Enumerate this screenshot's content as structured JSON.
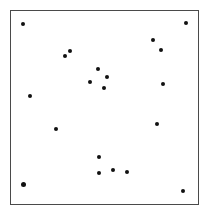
{
  "diagram": {
    "type": "dot-scatter-frame",
    "frame": {
      "x": 10,
      "y": 10,
      "width": 189,
      "height": 195,
      "border_color": "#4a4a4a"
    },
    "dot_color": "#111111",
    "points": [
      {
        "x": 23,
        "y": 24,
        "size": "normal"
      },
      {
        "x": 186,
        "y": 23,
        "size": "normal"
      },
      {
        "x": 65,
        "y": 56,
        "size": "normal"
      },
      {
        "x": 70,
        "y": 51,
        "size": "normal"
      },
      {
        "x": 153,
        "y": 40,
        "size": "normal"
      },
      {
        "x": 161,
        "y": 50,
        "size": "normal"
      },
      {
        "x": 98,
        "y": 69,
        "size": "normal"
      },
      {
        "x": 107,
        "y": 77,
        "size": "normal"
      },
      {
        "x": 90,
        "y": 82,
        "size": "normal"
      },
      {
        "x": 104,
        "y": 88,
        "size": "normal"
      },
      {
        "x": 163,
        "y": 84,
        "size": "normal"
      },
      {
        "x": 30,
        "y": 96,
        "size": "normal"
      },
      {
        "x": 56,
        "y": 129,
        "size": "normal"
      },
      {
        "x": 157,
        "y": 124,
        "size": "normal"
      },
      {
        "x": 99,
        "y": 157,
        "size": "normal"
      },
      {
        "x": 99,
        "y": 173,
        "size": "normal"
      },
      {
        "x": 113,
        "y": 170,
        "size": "normal"
      },
      {
        "x": 127,
        "y": 172,
        "size": "normal"
      },
      {
        "x": 23,
        "y": 184,
        "size": "large"
      },
      {
        "x": 183,
        "y": 191,
        "size": "normal"
      }
    ]
  }
}
